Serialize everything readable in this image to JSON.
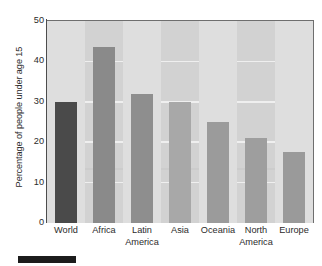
{
  "chart_data": {
    "type": "bar",
    "title": "",
    "xlabel": "",
    "ylabel": "Percentage of people under age 15",
    "categories": [
      "World",
      "Africa",
      "Latin America",
      "Asia",
      "Oceania",
      "North America",
      "Europe"
    ],
    "category_lines": [
      [
        "World",
        ""
      ],
      [
        "Africa",
        ""
      ],
      [
        "Latin",
        "America"
      ],
      [
        "Asia",
        ""
      ],
      [
        "Oceania",
        ""
      ],
      [
        "North",
        "America"
      ],
      [
        "Europe",
        ""
      ]
    ],
    "values": [
      30,
      43.5,
      32,
      30,
      25,
      21,
      17.5
    ],
    "ylim": [
      0,
      50
    ],
    "yticks": [
      50,
      40,
      30,
      20,
      10,
      0
    ],
    "ytick_labels": [
      "50",
      "40",
      "30",
      "20",
      "10",
      "0"
    ],
    "grid": true,
    "legend": "none",
    "bar_colors": [
      "#4a4a4a",
      "#8a8a8a",
      "#8e8e8e",
      "#a8a8a8",
      "#9b9b9b",
      "#9e9e9e",
      "#9a9a9a"
    ],
    "plot_background": "#d2d2d2",
    "band_color": "#dedede",
    "gridline_color": "#efefef",
    "axis_color": "#4d4d4d",
    "text_color": "#2b2b2b"
  }
}
